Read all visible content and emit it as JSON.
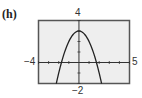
{
  "panel": {
    "label": "(h)"
  },
  "chart_data": {
    "type": "line",
    "title": "",
    "xlabel": "",
    "ylabel": "",
    "xlim": [
      -4,
      5
    ],
    "ylim": [
      -2,
      4
    ],
    "window_labels": {
      "xmin": "−4",
      "xmax": "5",
      "ymin": "−2",
      "ymax": "4"
    },
    "grid": false,
    "tick_spacing": 1,
    "series": [
      {
        "name": "y = 3 − x²",
        "x": [
          -2.24,
          -2,
          -1.5,
          -1,
          -0.5,
          0,
          0.5,
          1,
          1.5,
          2,
          2.24
        ],
        "y": [
          -2,
          -1,
          0.75,
          2,
          2.75,
          3,
          2.75,
          2,
          0.75,
          -1,
          -2
        ]
      }
    ]
  },
  "colors": {
    "frame": "#555555",
    "background": "#eeeeee",
    "curve": "#222222",
    "axes": "#333333"
  }
}
